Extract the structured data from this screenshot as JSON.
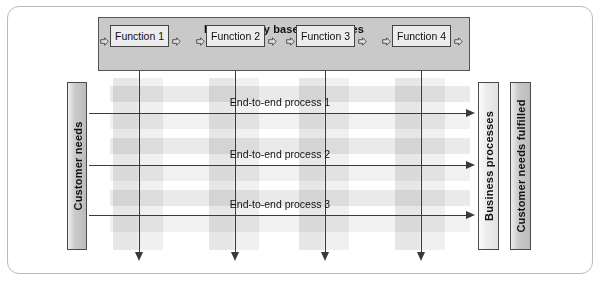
{
  "diagram": {
    "title": "Functionally based processes",
    "functions": [
      {
        "label": "Function 1",
        "left": 110,
        "width": 59
      },
      {
        "label": "Function 2",
        "left": 206,
        "width": 59
      },
      {
        "label": "Function 3",
        "left": 296,
        "width": 59
      },
      {
        "label": "Function 4",
        "left": 392,
        "width": 59
      }
    ],
    "connector_icon": "block-arrow-right-icon",
    "connectors": [
      {
        "left": 100
      },
      {
        "left": 172
      },
      {
        "left": 196
      },
      {
        "left": 268
      },
      {
        "left": 286
      },
      {
        "left": 358
      },
      {
        "left": 382
      },
      {
        "left": 454
      }
    ],
    "input_bar": {
      "label": "Customer needs",
      "left": 67,
      "top": 82,
      "width": 20,
      "height": 168,
      "shade": "dark"
    },
    "output_bars": [
      {
        "label": "Business processes",
        "left": 478,
        "top": 82,
        "width": 21,
        "height": 168,
        "shade": "light"
      },
      {
        "label": "Customer needs fulfilled",
        "left": 510,
        "top": 82,
        "width": 21,
        "height": 168,
        "shade": "dark"
      }
    ],
    "end_to_end_processes": [
      {
        "label": "End-to-end process 1",
        "y": 113,
        "label_y": 96
      },
      {
        "label": "End-to-end process 2",
        "y": 165,
        "label_y": 148
      },
      {
        "label": "End-to-end process 3",
        "y": 215,
        "label_y": 198
      }
    ],
    "horizontal_flow": {
      "x_start": 89,
      "x_end": 466,
      "arrow_x": 466
    },
    "vertical_flows": [
      {
        "x": 139,
        "y_start": 71,
        "y_end": 252
      },
      {
        "x": 235,
        "y_start": 71,
        "y_end": 252
      },
      {
        "x": 325,
        "y_start": 71,
        "y_end": 252
      },
      {
        "x": 421,
        "y_start": 71,
        "y_end": 252
      }
    ],
    "grid_bands": {
      "vertical": [
        {
          "left": 113,
          "top": 78,
          "width": 25,
          "height": 172
        },
        {
          "left": 138,
          "top": 78,
          "width": 25,
          "height": 172
        },
        {
          "left": 209,
          "top": 78,
          "width": 25,
          "height": 172
        },
        {
          "left": 234,
          "top": 78,
          "width": 25,
          "height": 172
        },
        {
          "left": 299,
          "top": 78,
          "width": 25,
          "height": 172
        },
        {
          "left": 324,
          "top": 78,
          "width": 25,
          "height": 172
        },
        {
          "left": 395,
          "top": 78,
          "width": 25,
          "height": 172
        },
        {
          "left": 420,
          "top": 78,
          "width": 25,
          "height": 172
        }
      ],
      "horizontal": [
        {
          "left": 110,
          "top": 86,
          "width": 360,
          "height": 16
        },
        {
          "left": 110,
          "top": 113,
          "width": 360,
          "height": 16
        },
        {
          "left": 110,
          "top": 138,
          "width": 360,
          "height": 16
        },
        {
          "left": 110,
          "top": 165,
          "width": 360,
          "height": 16
        },
        {
          "left": 110,
          "top": 190,
          "width": 360,
          "height": 16
        },
        {
          "left": 110,
          "top": 216,
          "width": 360,
          "height": 16
        }
      ]
    },
    "colors": {
      "panel_fill": "#c9c9c9",
      "box_fill": "#ececec",
      "band_fill": "#e3e3e3",
      "line": "#3a3a3a",
      "frame_border": "#b9b9b9"
    }
  }
}
